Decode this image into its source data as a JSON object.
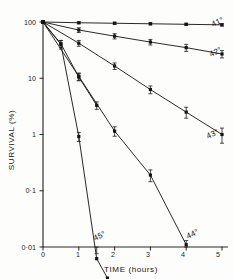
{
  "chart_data": {
    "type": "line",
    "title": "",
    "xlabel": "TIME (hours)",
    "ylabel": "SURVIVAL (%)",
    "yscale": "log",
    "xscale": "linear",
    "xlim": [
      0,
      5
    ],
    "ylim": [
      0.01,
      100
    ],
    "grid": false,
    "legend_position": "inline-right-end-of-curve",
    "x_tick_labels": [
      "0",
      "1",
      "2",
      "3",
      "4",
      "5"
    ],
    "x_ticks": [
      0,
      1,
      2,
      3,
      4,
      5
    ],
    "y_tick_labels": [
      "100",
      "10",
      "1",
      "0·1",
      "0·01"
    ],
    "y_ticks": [
      100,
      10,
      1,
      0.1,
      0.01
    ],
    "marker": "square-with-error-bars",
    "series": [
      {
        "name": "41°",
        "label": "41°",
        "x": [
          0,
          1,
          2,
          3,
          4,
          5
        ],
        "values": [
          100,
          97,
          95,
          93,
          91,
          89
        ],
        "yerr": [
          0,
          4,
          4,
          4,
          4,
          4
        ]
      },
      {
        "name": "42°",
        "label": "42°",
        "x": [
          0,
          1,
          2,
          3,
          4,
          5
        ],
        "values": [
          100,
          72,
          56,
          44,
          35,
          27
        ],
        "yerr": [
          0,
          7,
          6,
          5,
          5,
          4
        ]
      },
      {
        "name": "43°",
        "label": "43°",
        "x": [
          0,
          1,
          2,
          3,
          4,
          5
        ],
        "values": [
          100,
          42,
          16.5,
          6.3,
          2.5,
          1.0
        ],
        "yerr": [
          0,
          5,
          2.2,
          1.0,
          0.55,
          0.3
        ]
      },
      {
        "name": "44°",
        "label": "44°",
        "x": [
          0,
          1,
          2,
          3,
          4
        ],
        "values": [
          100,
          10.8,
          1.15,
          0.19,
          0.011
        ],
        "yerr": [
          0,
          1.6,
          0.22,
          0.045,
          0.002
        ]
      },
      {
        "name": "45°",
        "label": "45°",
        "x": [
          0,
          0.5,
          1,
          1.5,
          1.8
        ],
        "values": [
          100,
          40,
          0.92,
          0.0062,
          0.0028
        ],
        "yerr": [
          0,
          7,
          0.17,
          0.0014,
          0
        ]
      },
      {
        "name": "45°-upper-segment",
        "label": "",
        "x": [
          0,
          0.5,
          1,
          1.5
        ],
        "values": [
          100,
          41,
          10.5,
          3.3
        ],
        "yerr": [
          0,
          6,
          1.5,
          0.5
        ]
      }
    ]
  },
  "axes": {
    "x_title": "TIME (hours)",
    "y_title": "SURVIVAL (%)"
  },
  "labels": {
    "s41": "41°",
    "s42": "42°",
    "s43": "43°",
    "s44": "44°",
    "s45": "45°"
  },
  "ticks": {
    "x0": "0",
    "x1": "1",
    "x2": "2",
    "x3": "3",
    "x4": "4",
    "x5": "5",
    "y100": "100",
    "y10": "10",
    "y1": "1",
    "y01": "0·1",
    "y001": "0·01"
  },
  "style": {
    "ink": "#1d1d1d",
    "paper": "#fdfdfc"
  }
}
